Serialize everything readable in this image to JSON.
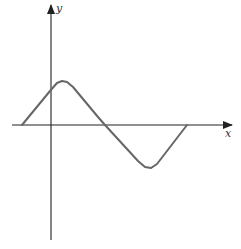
{
  "chart_data": {
    "type": "line",
    "title": "",
    "xlabel": "x",
    "ylabel": "y",
    "grid": false,
    "legend": null,
    "series": [
      {
        "name": "curve",
        "color": "#666666",
        "points_px": [
          [
            22,
            125
          ],
          [
            50,
            91
          ],
          [
            57,
            83
          ],
          [
            62,
            81
          ],
          [
            67,
            82
          ],
          [
            73,
            87
          ],
          [
            98,
            117
          ],
          [
            105,
            125
          ],
          [
            138,
            161
          ],
          [
            145,
            167
          ],
          [
            151,
            168
          ],
          [
            157,
            164
          ],
          [
            187,
            125
          ]
        ]
      }
    ],
    "axes": {
      "color": "#222222",
      "x_axis": {
        "y": 125,
        "x_start": 12,
        "x_end": 232
      },
      "y_axis": {
        "x": 51,
        "y_start": 240,
        "y_end": 5
      }
    }
  },
  "labels": {
    "x": "x",
    "y": "y"
  }
}
